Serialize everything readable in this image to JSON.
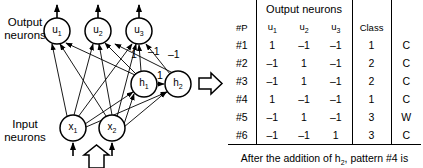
{
  "diagram": {
    "output_label": "Output\nneurons",
    "output_label_line1": "Output",
    "output_label_line2": "neurons",
    "input_label_line1": "Input",
    "input_label_line2": "neurons",
    "nodes": {
      "output": [
        {
          "id": "u1",
          "base": "u",
          "sub": "1",
          "cx": 57,
          "cy": 31,
          "r": 13
        },
        {
          "id": "u2",
          "base": "u",
          "sub": "2",
          "cx": 98,
          "cy": 31,
          "r": 13
        },
        {
          "id": "u3",
          "base": "u",
          "sub": "3",
          "cx": 139,
          "cy": 31,
          "r": 13
        }
      ],
      "hidden": [
        {
          "id": "h1",
          "base": "h",
          "sub": "1",
          "cx": 144,
          "cy": 84,
          "r": 13
        },
        {
          "id": "h2",
          "base": "h",
          "sub": "2",
          "cx": 178,
          "cy": 84,
          "r": 13
        }
      ],
      "input": [
        {
          "id": "x1",
          "base": "x",
          "sub": "1",
          "cx": 73,
          "cy": 128,
          "r": 13
        },
        {
          "id": "x2",
          "base": "x",
          "sub": "2",
          "cx": 112,
          "cy": 128,
          "r": 13
        }
      ]
    },
    "weights": [
      {
        "text": "1",
        "x": 134,
        "y": 55
      },
      {
        "text": "–1",
        "x": 152,
        "y": 52
      },
      {
        "text": "–1",
        "x": 172,
        "y": 56
      },
      {
        "text": "1",
        "x": 160,
        "y": 76
      }
    ],
    "flow_arrow_right": "flow-arrow-right",
    "flow_arrow_up": "flow-arrow-up"
  },
  "table": {
    "group_header": "Output neurons",
    "columns": {
      "pattern": "#P",
      "u1_base": "u",
      "u1_sub": "1",
      "u2_base": "u",
      "u2_sub": "2",
      "u3_base": "u",
      "u3_sub": "3",
      "class": "Class",
      "result": ""
    },
    "rows": [
      {
        "pattern": "#1",
        "u1": "1",
        "u2": "–1",
        "u3": "–1",
        "class": "1",
        "result": "C",
        "bold": false
      },
      {
        "pattern": "#2",
        "u1": "–1",
        "u2": "1",
        "u3": "–1",
        "class": "2",
        "result": "C",
        "bold": false
      },
      {
        "pattern": "#3",
        "u1": "–1",
        "u2": "1",
        "u3": "–1",
        "class": "2",
        "result": "C",
        "bold": false
      },
      {
        "pattern": "#4",
        "u1": "1",
        "u2": "–1",
        "u3": "–1",
        "class": "1",
        "result": "C",
        "bold": true
      },
      {
        "pattern": "#5",
        "u1": "–1",
        "u2": "1",
        "u3": "–1",
        "class": "3",
        "result": "W",
        "bold": false
      },
      {
        "pattern": "#6",
        "u1": "–1",
        "u2": "–1",
        "u3": "1",
        "class": "3",
        "result": "C",
        "bold": false
      }
    ],
    "caption_pre": "After the addition of h",
    "caption_sub": "2",
    "caption_post": ", pattern #4 is"
  },
  "colors": {
    "ink": "#000000",
    "paper": "#ffffff"
  }
}
